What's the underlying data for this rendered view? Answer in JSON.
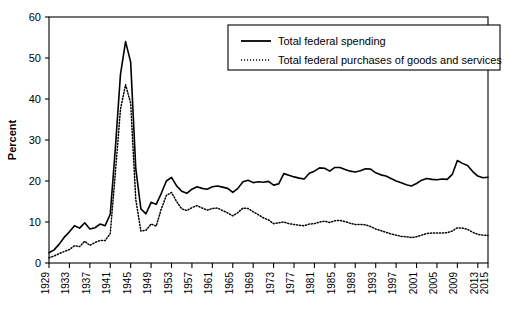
{
  "chart_data": {
    "type": "line",
    "title": "",
    "xlabel": "",
    "ylabel": "Percent",
    "xlim": [
      1929,
      2015
    ],
    "ylim": [
      0,
      60
    ],
    "yticks": [
      0,
      10,
      20,
      30,
      40,
      50,
      60
    ],
    "xticks": [
      1929,
      1933,
      1937,
      1941,
      1945,
      1949,
      1953,
      1957,
      1961,
      1965,
      1969,
      1973,
      1977,
      1981,
      1985,
      1989,
      1993,
      1997,
      2001,
      2005,
      2009,
      2013,
      2015
    ],
    "xtick_labels": [
      "1929",
      "1933",
      "1937",
      "1941",
      "1945",
      "1949",
      "1953",
      "1957",
      "1961",
      "1965",
      "1969",
      "1973",
      "1977",
      "1981",
      "1985",
      "1989",
      "1993",
      "1997",
      "2001",
      "2005",
      "2009",
      "2013",
      "2015"
    ],
    "ytick_labels": [
      "0",
      "10",
      "20",
      "30",
      "40",
      "50",
      "60"
    ],
    "grid": false,
    "legend_position": "top-right",
    "x": [
      1929,
      1930,
      1931,
      1932,
      1933,
      1934,
      1935,
      1936,
      1937,
      1938,
      1939,
      1940,
      1941,
      1942,
      1943,
      1944,
      1945,
      1946,
      1947,
      1948,
      1949,
      1950,
      1951,
      1952,
      1953,
      1954,
      1955,
      1956,
      1957,
      1958,
      1959,
      1960,
      1961,
      1962,
      1963,
      1964,
      1965,
      1966,
      1967,
      1968,
      1969,
      1970,
      1971,
      1972,
      1973,
      1974,
      1975,
      1976,
      1977,
      1978,
      1979,
      1980,
      1981,
      1982,
      1983,
      1984,
      1985,
      1986,
      1987,
      1988,
      1989,
      1990,
      1991,
      1992,
      1993,
      1994,
      1995,
      1996,
      1997,
      1998,
      1999,
      2000,
      2001,
      2002,
      2003,
      2004,
      2005,
      2006,
      2007,
      2008,
      2009,
      2010,
      2011,
      2012,
      2013,
      2014,
      2015
    ],
    "series": [
      {
        "name": "Total federal spending",
        "style": "solid",
        "color": "#000000",
        "values": [
          2.5,
          3.2,
          4.6,
          6.3,
          7.6,
          9.1,
          8.5,
          9.8,
          8.3,
          8.6,
          9.5,
          9.1,
          11.9,
          28.0,
          46.0,
          54.0,
          49.0,
          23.0,
          13.2,
          12.0,
          14.8,
          14.3,
          17.0,
          20.0,
          20.9,
          18.8,
          17.5,
          17.0,
          18.0,
          18.6,
          18.2,
          18.0,
          18.6,
          18.8,
          18.5,
          18.2,
          17.2,
          18.2,
          19.8,
          20.2,
          19.6,
          19.8,
          19.7,
          19.9,
          19.0,
          19.3,
          21.8,
          21.4,
          21.0,
          20.7,
          20.5,
          21.9,
          22.4,
          23.2,
          23.1,
          22.4,
          23.3,
          23.3,
          22.8,
          22.4,
          22.2,
          22.5,
          23.0,
          22.9,
          22.0,
          21.5,
          21.2,
          20.6,
          20.0,
          19.6,
          19.1,
          18.8,
          19.4,
          20.2,
          20.6,
          20.4,
          20.3,
          20.5,
          20.4,
          21.6,
          25.0,
          24.3,
          23.8,
          22.3,
          21.2,
          20.8,
          20.9
        ]
      },
      {
        "name": "Total federal purchases of goods and services",
        "style": "dotted",
        "color": "#000000",
        "values": [
          1.3,
          1.7,
          2.3,
          2.8,
          3.3,
          4.2,
          4.0,
          5.3,
          4.3,
          5.0,
          5.5,
          5.5,
          7.2,
          22.0,
          37.5,
          43.5,
          39.0,
          15.5,
          7.8,
          8.0,
          9.5,
          9.0,
          13.2,
          16.5,
          17.2,
          15.0,
          13.2,
          12.8,
          13.5,
          14.0,
          13.4,
          12.9,
          13.3,
          13.4,
          12.8,
          12.2,
          11.5,
          12.3,
          13.4,
          13.3,
          12.5,
          11.8,
          11.0,
          10.5,
          9.6,
          9.8,
          10.0,
          9.6,
          9.4,
          9.2,
          9.1,
          9.5,
          9.6,
          10.0,
          10.2,
          9.9,
          10.3,
          10.4,
          10.1,
          9.7,
          9.4,
          9.4,
          9.3,
          8.9,
          8.3,
          7.9,
          7.5,
          7.1,
          6.8,
          6.5,
          6.4,
          6.2,
          6.4,
          6.8,
          7.2,
          7.3,
          7.3,
          7.3,
          7.4,
          7.8,
          8.6,
          8.5,
          8.2,
          7.5,
          7.0,
          6.8,
          6.7
        ]
      }
    ]
  },
  "legend": {
    "items": [
      {
        "label": "Total federal spending",
        "style": "solid"
      },
      {
        "label": "Total federal purchases of goods and services",
        "style": "dotted"
      }
    ]
  }
}
